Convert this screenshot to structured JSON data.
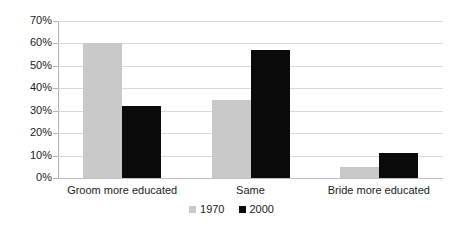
{
  "chart_data": {
    "type": "bar",
    "title": "",
    "subtitle": "",
    "xlabel": "",
    "ylabel": "",
    "ylim": [
      0,
      70
    ],
    "ytick_labels": [
      "0%",
      "10%",
      "20%",
      "30%",
      "40%",
      "50%",
      "60%",
      "70%"
    ],
    "ytick_values": [
      0,
      10,
      20,
      30,
      40,
      50,
      60,
      70
    ],
    "grid": true,
    "legend_position": "bottom-center",
    "categories": [
      "Groom more educated",
      "Same",
      "Bride more educated"
    ],
    "series": [
      {
        "name": "1970",
        "color": "#c9c9c9",
        "values": [
          60,
          35,
          5
        ]
      },
      {
        "name": "2000",
        "color": "#0a0a0a",
        "values": [
          32,
          57,
          11
        ]
      }
    ]
  },
  "legend": {
    "items": [
      {
        "label": "1970",
        "swatch": "legend-swatch-1970"
      },
      {
        "label": "2000",
        "swatch": "legend-swatch-2000"
      }
    ]
  }
}
